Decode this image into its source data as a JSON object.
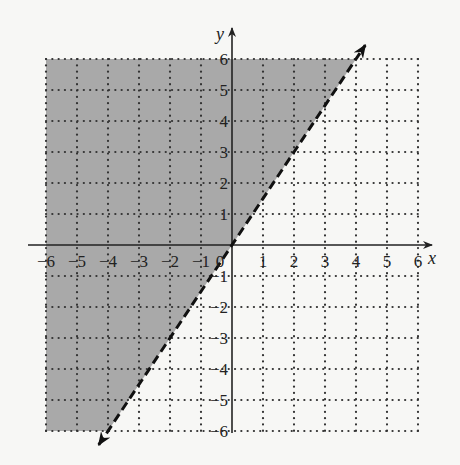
{
  "chart_data": {
    "type": "line",
    "title": "",
    "xlabel": "x",
    "ylabel": "y",
    "xlim": [
      -6,
      6
    ],
    "ylim": [
      -6,
      6
    ],
    "grid": true,
    "grid_style": "dotted",
    "x_ticks": [
      -6,
      -5,
      -4,
      -3,
      -2,
      -1,
      0,
      1,
      2,
      3,
      4,
      5,
      6
    ],
    "y_ticks": [
      -6,
      -5,
      -4,
      -3,
      -2,
      -1,
      1,
      2,
      3,
      4,
      5,
      6
    ],
    "x_tick_labels": [
      "−6",
      "−5",
      "−4",
      "−3",
      "−2",
      "−1",
      "0",
      "1",
      "2",
      "3",
      "4",
      "5",
      "6"
    ],
    "y_tick_labels": [
      "−6",
      "−5",
      "−4",
      "−3",
      "−2",
      "−1",
      "1",
      "2",
      "3",
      "4",
      "5",
      "6"
    ],
    "series": [
      {
        "name": "boundary line y = 3/2 x",
        "style": "dashed",
        "arrows": "both",
        "x": [
          -4,
          0,
          2,
          4
        ],
        "y": [
          -6,
          0,
          3,
          6
        ]
      }
    ],
    "shaded_region": {
      "inequality": "y > (3/2)x",
      "side": "above-left of line",
      "color": "#a9a9a9"
    }
  },
  "colors": {
    "background": "#f7f7f5",
    "shade": "#a9a9a9",
    "ink": "#222222"
  }
}
